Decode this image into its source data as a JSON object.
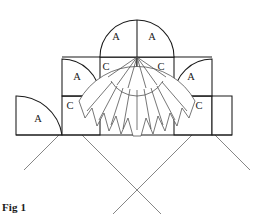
{
  "figure": {
    "caption": "Fig 1",
    "line_color": "#1a1a1a",
    "guide_color": "#707070",
    "shell_color": "#4a4a4a",
    "background": "#ffffff"
  },
  "labels": {
    "tier1_left": "A",
    "tier1_right": "A",
    "tier2_left_arch": "A",
    "tier2_left_block": "C",
    "tier2_right_block": "C",
    "tier2_right_arch": "A",
    "tier3_left_arch": "A",
    "tier3_left_block": "C",
    "tier3_right_block": "C"
  },
  "label_positions": [
    {
      "name": "tier1-left-A",
      "text": "A",
      "x": 116,
      "y": 38
    },
    {
      "name": "tier1-right-A",
      "text": "A",
      "x": 152,
      "y": 38
    },
    {
      "name": "tier2-left-arch-A",
      "text": "A",
      "x": 77,
      "y": 78
    },
    {
      "name": "tier2-left-block-C",
      "text": "C",
      "x": 106,
      "y": 68
    },
    {
      "name": "tier2-right-block-C",
      "text": "C",
      "x": 161,
      "y": 68
    },
    {
      "name": "tier2-right-arch-A",
      "text": "A",
      "x": 191,
      "y": 78
    },
    {
      "name": "tier3-left-arch-A",
      "text": "A",
      "x": 38,
      "y": 120
    },
    {
      "name": "tier3-left-block-C",
      "text": "C",
      "x": 70,
      "y": 107
    },
    {
      "name": "tier3-right-block-C",
      "text": "C",
      "x": 199,
      "y": 107
    }
  ],
  "geometry": {
    "apex": {
      "x": 137,
      "y": 14
    },
    "center_vertex": {
      "x": 137,
      "y": 57
    },
    "tier1": {
      "left": 100,
      "right": 174,
      "baseline": 57,
      "radius": 37
    },
    "tier2": {
      "left": 62,
      "right": 212,
      "baseline": 96,
      "radius": 37
    },
    "tier3": {
      "left": 16,
      "right": 232,
      "baseline": 135,
      "radius": 46
    },
    "diagonal_cross": {
      "x": 136,
      "y": 191
    },
    "shell": {
      "center": {
        "x": 137,
        "y": 57
      },
      "inner_radius": 30,
      "outer_radius": 66,
      "petals": 11,
      "start_angle": 208,
      "end_angle": 332
    }
  }
}
